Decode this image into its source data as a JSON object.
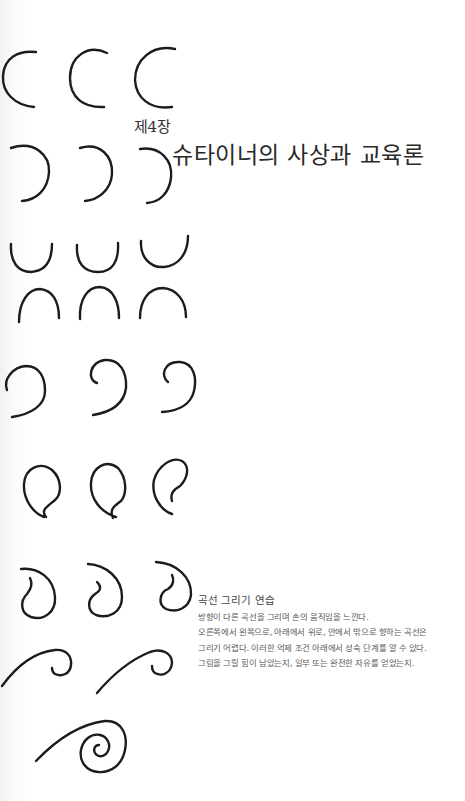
{
  "chapter": {
    "label": "제4장",
    "title": "슈타이너의 사상과 교육론"
  },
  "caption": {
    "title": "곡선 그리기 연습",
    "lines": [
      "방향이 다른 곡선을 그리며 손의 움직임을 느낀다.",
      "오른쪽에서 왼쪽으로, 아래에서 위로, 안에서 밖으로 향하는 곡선은",
      "그리기 어렵다. 이러한 억제 조건 아래에서 성숙 단계를 알 수 있다.",
      "그림을 그릴 힘이 남았는지, 일부 또는 완전한 자유를 얻었는지."
    ]
  },
  "drawings": {
    "rows": [
      {
        "shape": "left-open-arc",
        "count": 3
      },
      {
        "shape": "right-open-arc",
        "count": 3
      },
      {
        "shape": "u-cup",
        "count": 3
      },
      {
        "shape": "n-arch",
        "count": 3
      },
      {
        "shape": "hook-curl",
        "count": 3
      },
      {
        "shape": "inward-spiral-left",
        "count": 3
      },
      {
        "shape": "inward-spiral-bottom",
        "count": 3
      },
      {
        "shape": "wave-curl",
        "count": 2
      },
      {
        "shape": "spiral",
        "count": 1
      }
    ]
  },
  "colors": {
    "ink": "#1c1c1c",
    "paper": "#ffffff",
    "text": "#333333"
  }
}
